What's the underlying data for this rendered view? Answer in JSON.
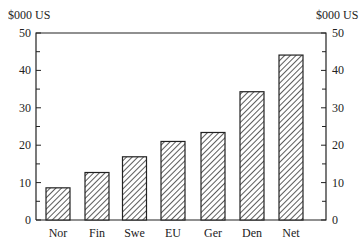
{
  "chart_data": {
    "type": "bar",
    "title": "",
    "xlabel": "",
    "ylabel": "$000 US",
    "ylabel_right": "$000 US",
    "categories": [
      "Nor",
      "Fin",
      "Swe",
      "EU",
      "Ger",
      "Den",
      "Net"
    ],
    "values": [
      8.6,
      12.7,
      16.9,
      21.0,
      23.4,
      34.3,
      44.1
    ],
    "ylim": [
      0,
      50
    ],
    "yticks": [
      0,
      10,
      20,
      30,
      40,
      50
    ],
    "minor_ytick_step": 5,
    "grid": false,
    "legend": null,
    "bar_fill": "diagonal-hatch",
    "colors": {
      "ink": "#222222",
      "background": "#ffffff"
    }
  }
}
